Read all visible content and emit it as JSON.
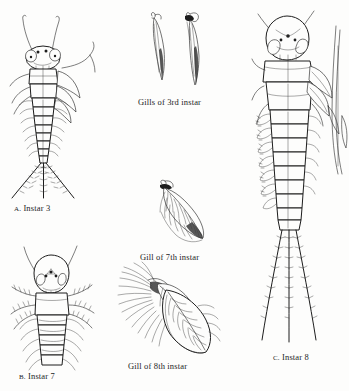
{
  "plate": {
    "title": "Mayfly nymph instars and gill development plate",
    "background_color": "#fdfdfc",
    "ink_color": "#1d1d1d",
    "figure_count": 6
  },
  "captions": {
    "instar3": "A. Instar 3",
    "instar3_letter": "A.",
    "instar3_text": "Instar 3",
    "gills_3rd": "Gills of 3rd instar",
    "gill_7th": "Gill of 7th instar",
    "gill_8th": "Gill of 8th instar",
    "instar7": "B. Instar 7",
    "instar7_letter": "B.",
    "instar7_text": "Instar 7",
    "instar8": "C. Instar 8",
    "instar8_letter": "C.",
    "instar8_text": "Instar 8"
  },
  "figures": [
    {
      "id": "instar-3-nymph",
      "label": "A. Instar 3",
      "subject": "whole mayfly nymph, dorsal view",
      "features": [
        "paired antennae",
        "compound eyes",
        "three ocelli",
        "thorax",
        "segmented abdomen",
        "lateral gill filaments",
        "three caudal filaments"
      ]
    },
    {
      "id": "gills-3rd-instar",
      "label": "Gills of 3rd instar",
      "subject": "two slender simple gills",
      "features": [
        "narrow lamella",
        "dark pigmented margin",
        "basal attachment"
      ]
    },
    {
      "id": "gill-7th-instar",
      "label": "Gill of 7th instar",
      "subject": "single leaf-shaped lamellate gill",
      "features": [
        "broad lamella",
        "tracheal branching",
        "fibrillar fringe"
      ]
    },
    {
      "id": "gill-8th-instar",
      "label": "Gill of 8th instar",
      "subject": "fully developed double gill",
      "features": [
        "large oval lamella",
        "central trachea",
        "dense fibrillar tuft",
        "pinnate veins"
      ]
    },
    {
      "id": "instar-7-nymph",
      "label": "B. Instar 7",
      "subject": "nymph head and thorax, dorsal view",
      "features": [
        "long antennae",
        "large compound eyes",
        "three ocelli",
        "setose legs",
        "segmented abdomen"
      ]
    },
    {
      "id": "instar-8-nymph",
      "label": "C. Instar 8",
      "subject": "whole mature nymph, dorsal view",
      "features": [
        "developed wing pads",
        "compound eyes",
        "abdominal gills",
        "three long setose caudal filaments"
      ]
    }
  ]
}
